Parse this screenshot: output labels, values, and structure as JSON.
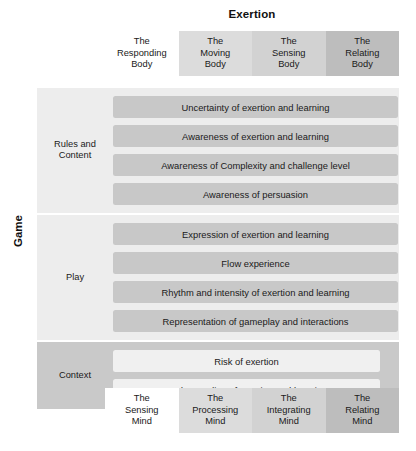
{
  "axes": {
    "top_title": "Exertion",
    "left_title": "Game"
  },
  "columns_top": [
    {
      "line1": "The",
      "line2": "Responding",
      "line3": "Body",
      "shade": "shade-0"
    },
    {
      "line1": "The",
      "line2": "Moving",
      "line3": "Body",
      "shade": "shade-1"
    },
    {
      "line1": "The",
      "line2": "Sensing",
      "line3": "Body",
      "shade": "shade-2"
    },
    {
      "line1": "The",
      "line2": "Relating",
      "line3": "Body",
      "shade": "shade-3"
    }
  ],
  "columns_bottom": [
    {
      "line1": "The",
      "line2": "Sensing",
      "line3": "Mind",
      "shade": "shade-0"
    },
    {
      "line1": "The",
      "line2": "Processing",
      "line3": "Mind",
      "shade": "shade-1"
    },
    {
      "line1": "The",
      "line2": "Integrating",
      "line3": "Mind",
      "shade": "shade-2"
    },
    {
      "line1": "The",
      "line2": "Relating",
      "line3": "Mind",
      "shade": "shade-3"
    }
  ],
  "row_groups": [
    {
      "label_line1": "Rules and",
      "label_line2": "Content",
      "band_style": "band-light",
      "bar_style": "bar-grey",
      "items": [
        "Uncertainty of exertion and learning",
        "Awareness of exertion and learning",
        "Awareness of Complexity and challenge level",
        "Awareness of persuasion"
      ]
    },
    {
      "label_line1": "Play",
      "label_line2": "",
      "band_style": "band-light",
      "bar_style": "bar-grey",
      "items": [
        "Expression of exertion and learning",
        "Flow experience",
        "Rhythm and intensity of exertion and learning",
        "Representation of gameplay and interactions"
      ]
    },
    {
      "label_line1": "Context",
      "label_line2": "",
      "band_style": "band-dark",
      "bar_style": "bar-white",
      "items": [
        "Risk of exertion",
        "Understanding of exertion and learning"
      ]
    }
  ],
  "colors": {
    "band_light": "#ededed",
    "band_dark": "#c9c9c9",
    "bar_grey": "#c8c8c8",
    "bar_white": "#f0f0f0",
    "column_shade_1": "#dcdcdc",
    "column_shade_2": "#d2d2d2",
    "column_shade_3": "#bdbdbd"
  }
}
